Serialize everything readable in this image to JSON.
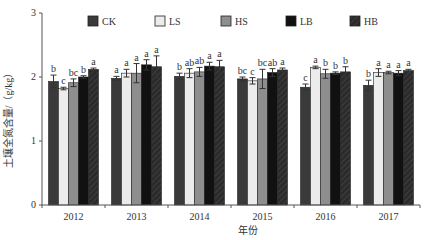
{
  "chart_data": {
    "type": "bar",
    "title": "",
    "xlabel": "年份",
    "ylabel": "土壤全氮含量/（g/kg）",
    "ylim": [
      0,
      3
    ],
    "yticks": [
      0,
      1,
      2,
      3
    ],
    "grid": false,
    "legend_position": "top",
    "categories": [
      "2012",
      "2013",
      "2014",
      "2015",
      "2016",
      "2017"
    ],
    "series": [
      {
        "name": "CK",
        "color": "#3a3a3a",
        "values": [
          1.93,
          1.98,
          2.01,
          1.97,
          1.84,
          1.87
        ],
        "errors": [
          0.1,
          0.03,
          0.05,
          0.03,
          0.05,
          0.08
        ],
        "labels": [
          "b",
          "a",
          "b",
          "bc",
          "c",
          "b"
        ]
      },
      {
        "name": "LS",
        "color": "#ececec",
        "values": [
          1.82,
          2.06,
          2.06,
          1.94,
          2.15,
          2.07
        ],
        "errors": [
          0.02,
          0.06,
          0.07,
          0.05,
          0.02,
          0.06
        ],
        "labels": [
          "c",
          "a",
          "ab",
          "c",
          "a",
          "a"
        ]
      },
      {
        "name": "HS",
        "color": "#8e8e8e",
        "values": [
          1.91,
          2.06,
          2.08,
          1.97,
          2.05,
          2.07
        ],
        "errors": [
          0.06,
          0.15,
          0.07,
          0.15,
          0.07,
          0.02
        ],
        "labels": [
          "bc",
          "a",
          "ab",
          "bc",
          "b",
          "a"
        ]
      },
      {
        "name": "LB",
        "color": "#111111",
        "values": [
          2.0,
          2.19,
          2.17,
          2.07,
          2.06,
          2.06
        ],
        "errors": [
          0.02,
          0.08,
          0.06,
          0.06,
          0.02,
          0.04
        ],
        "labels": [
          "b",
          "a",
          "a",
          "ab",
          "b",
          "a"
        ]
      },
      {
        "name": "HB",
        "color": "#2b2b2b",
        "values": [
          2.12,
          2.16,
          2.16,
          2.11,
          2.08,
          2.1
        ],
        "errors": [
          0.02,
          0.17,
          0.1,
          0.03,
          0.08,
          0.02
        ],
        "labels": [
          "a",
          "a",
          "a",
          "a",
          "b",
          "a"
        ]
      }
    ]
  }
}
